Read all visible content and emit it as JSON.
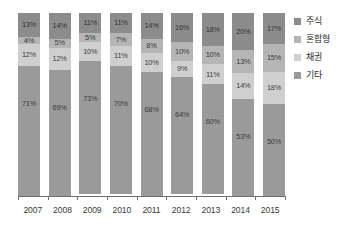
{
  "chart_data": {
    "type": "bar",
    "stacked": true,
    "stack_mode": "percent",
    "title": "",
    "subtitle": "",
    "xlabel": "",
    "ylabel": "",
    "ylim": [
      0,
      100
    ],
    "grid": false,
    "legend_position": "right",
    "value_suffix": "%",
    "categories": [
      "2007",
      "2008",
      "2009",
      "2010",
      "2011",
      "2012",
      "2013",
      "2014",
      "2015"
    ],
    "series": [
      {
        "name": "주식",
        "color": "#8c8c8c",
        "values": [
          13,
          14,
          11,
          11,
          14,
          16,
          18,
          20,
          17
        ],
        "labels": [
          "13%",
          "14%",
          "11%",
          "11%",
          "14%",
          "16%",
          "18%",
          "20%",
          "17%"
        ]
      },
      {
        "name": "혼합형",
        "color": "#b5b5b5",
        "values": [
          4,
          5,
          5,
          7,
          8,
          10,
          10,
          13,
          15
        ],
        "labels": [
          "4%",
          "5%",
          "5%",
          "7%",
          "8%",
          "10%",
          "10%",
          "13%",
          "15%"
        ]
      },
      {
        "name": "채권",
        "color": "#cfcfcf",
        "values": [
          12,
          12,
          10,
          11,
          10,
          9,
          11,
          14,
          18
        ],
        "labels": [
          "12%",
          "12%",
          "10%",
          "11%",
          "10%",
          "9%",
          "11%",
          "14%",
          "18%"
        ]
      },
      {
        "name": "기타",
        "color": "#9a9a9a",
        "values": [
          71,
          69,
          73,
          70,
          68,
          64,
          60,
          53,
          50
        ],
        "labels": [
          "71%",
          "69%",
          "73%",
          "70%",
          "68%",
          "64%",
          "60%",
          "53%",
          "50%"
        ]
      }
    ]
  },
  "legend": {
    "items": [
      {
        "label": "주식",
        "color": "#8c8c8c"
      },
      {
        "label": "혼합형",
        "color": "#b5b5b5"
      },
      {
        "label": "채권",
        "color": "#cfcfcf"
      },
      {
        "label": "기타",
        "color": "#9a9a9a"
      }
    ]
  },
  "axis": {
    "tick_color": "#6e6e6e"
  }
}
